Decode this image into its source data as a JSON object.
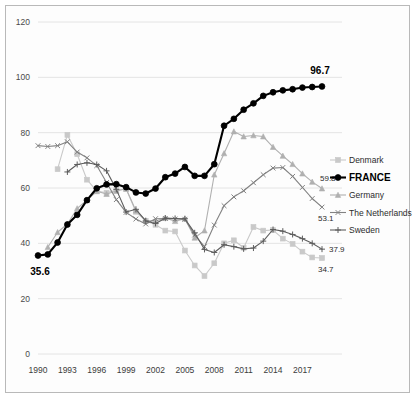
{
  "chart_data": {
    "type": "line",
    "title": "",
    "subtitle": "",
    "xlabel": "",
    "ylabel": "",
    "xlim": [
      1990,
      2019
    ],
    "ylim": [
      0,
      120
    ],
    "grid": true,
    "legend_position": "right",
    "x": [
      1990,
      1991,
      1992,
      1993,
      1994,
      1995,
      1996,
      1997,
      1998,
      1999,
      2000,
      2001,
      2002,
      2003,
      2004,
      2005,
      2006,
      2007,
      2008,
      2009,
      2010,
      2011,
      2012,
      2013,
      2014,
      2015,
      2016,
      2017,
      2018,
      2019
    ],
    "xticks": [
      1990,
      1993,
      1996,
      1999,
      2002,
      2005,
      2008,
      2011,
      2014,
      2017
    ],
    "yticks": [
      0,
      20,
      40,
      60,
      80,
      100,
      120
    ],
    "series": [
      {
        "name": "Denmark",
        "color": "#c9c9c9",
        "marker": "square",
        "bold": false,
        "end_label": "34.7",
        "values": [
          null,
          null,
          66.8,
          79.2,
          72.2,
          63.0,
          58.9,
          58.3,
          59.3,
          59.6,
          51.4,
          48.1,
          46.7,
          44.6,
          44.3,
          37.4,
          32.0,
          28.2,
          32.8,
          40.0,
          41.1,
          38.4,
          45.9,
          44.6,
          44.8,
          41.7,
          39.8,
          37.0,
          34.9,
          34.7
        ]
      },
      {
        "name": "FRANCE",
        "color": "#000000",
        "marker": "circle",
        "bold": true,
        "start_label": "35.6",
        "end_label": "96.7",
        "values": [
          35.6,
          36.0,
          40.3,
          46.8,
          50.3,
          55.6,
          59.9,
          61.3,
          61.4,
          60.3,
          58.4,
          58.0,
          59.8,
          63.9,
          65.2,
          67.6,
          64.4,
          64.4,
          68.6,
          82.5,
          85.0,
          88.3,
          90.6,
          93.3,
          94.6,
          95.3,
          95.7,
          96.3,
          96.5,
          96.7
        ]
      },
      {
        "name": "Germany",
        "color": "#b0b0b0",
        "marker": "triangle",
        "bold": false,
        "end_label": "59.8",
        "values": [
          null,
          38.6,
          44.0,
          47.0,
          52.6,
          55.6,
          58.8,
          57.8,
          58.9,
          59.7,
          51.8,
          48.3,
          48.0,
          49.2,
          48.0,
          48.9,
          42.0,
          44.6,
          64.8,
          72.5,
          80.4,
          78.6,
          79.0,
          78.6,
          74.8,
          71.6,
          68.6,
          65.2,
          62.2,
          59.8
        ]
      },
      {
        "name": "The Netherlands",
        "color": "#828282",
        "marker": "x",
        "bold": false,
        "end_label": "53.1",
        "values": [
          75.3,
          75.0,
          75.3,
          76.7,
          73.0,
          70.9,
          68.1,
          62.0,
          55.8,
          51.2,
          48.8,
          47.0,
          48.9,
          49.0,
          48.8,
          48.7,
          43.0,
          38.8,
          46.6,
          53.6,
          56.8,
          59.0,
          61.9,
          64.8,
          67.2,
          67.4,
          64.2,
          60.2,
          56.2,
          53.1
        ]
      },
      {
        "name": "Sweden",
        "color": "#5d5d5d",
        "marker": "plus",
        "bold": false,
        "end_label": "37.9",
        "values": [
          null,
          null,
          null,
          65.8,
          68.5,
          69.1,
          68.5,
          66.2,
          59.5,
          51.3,
          52.3,
          48.1,
          47.2,
          49.1,
          49.0,
          48.9,
          43.8,
          37.8,
          36.7,
          39.5,
          38.8,
          38.0,
          38.3,
          40.8,
          45.0,
          44.4,
          43.2,
          41.7,
          40.0,
          37.9
        ]
      }
    ]
  }
}
